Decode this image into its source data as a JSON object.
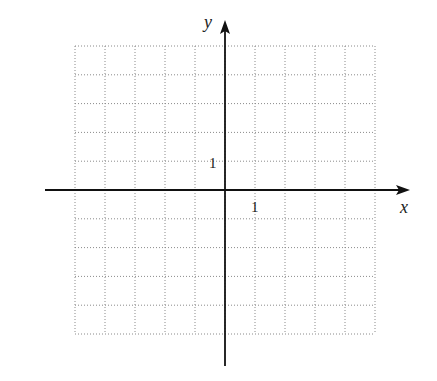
{
  "diagram": {
    "type": "coordinate_plane",
    "axes": {
      "x_label": "x",
      "y_label": "y",
      "x_tick_label": "1",
      "y_tick_label": "1"
    },
    "grid": {
      "x_min": -5,
      "x_max": 5,
      "y_min": -5,
      "y_max": 5,
      "step": 1,
      "style": "dotted",
      "color": "#8a8a8a"
    },
    "axis_color": "#111111"
  }
}
